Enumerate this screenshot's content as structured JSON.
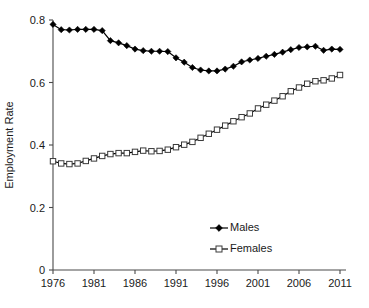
{
  "chart_data": {
    "type": "line",
    "title": "",
    "xlabel": "",
    "ylabel": "Employment Rate",
    "xlim": [
      1976,
      2011
    ],
    "ylim": [
      0,
      0.8
    ],
    "grid": false,
    "legend_position": "bottom-center",
    "xticks": [
      1976,
      1981,
      1986,
      1991,
      1996,
      2001,
      2006,
      2011
    ],
    "xtick_labels": [
      "1976",
      "1981",
      "1986",
      "1991",
      "1996",
      "2001",
      "2006",
      "2011"
    ],
    "yticks": [
      0,
      0.2,
      0.4,
      0.6,
      0.8
    ],
    "ytick_labels": [
      "0",
      "0.2",
      "0.4",
      "0.6",
      "0.8"
    ],
    "x": [
      1976,
      1977,
      1978,
      1979,
      1980,
      1981,
      1982,
      1983,
      1984,
      1985,
      1986,
      1987,
      1988,
      1989,
      1990,
      1991,
      1992,
      1993,
      1994,
      1995,
      1996,
      1997,
      1998,
      1999,
      2000,
      2001,
      2002,
      2003,
      2004,
      2005,
      2006,
      2007,
      2008,
      2009,
      2010,
      2011
    ],
    "series": [
      {
        "name": "Males",
        "marker": "filled-diamond",
        "color": "#000000",
        "values": [
          0.786,
          0.769,
          0.768,
          0.77,
          0.77,
          0.77,
          0.766,
          0.734,
          0.727,
          0.718,
          0.707,
          0.702,
          0.7,
          0.7,
          0.699,
          0.679,
          0.665,
          0.648,
          0.64,
          0.637,
          0.637,
          0.643,
          0.652,
          0.666,
          0.672,
          0.677,
          0.684,
          0.69,
          0.697,
          0.705,
          0.712,
          0.714,
          0.716,
          0.703,
          0.707,
          0.706
        ]
      },
      {
        "name": "Females",
        "marker": "open-square",
        "color": "#3a3a3a",
        "values": [
          0.348,
          0.341,
          0.339,
          0.341,
          0.349,
          0.357,
          0.365,
          0.371,
          0.374,
          0.374,
          0.378,
          0.382,
          0.38,
          0.381,
          0.385,
          0.393,
          0.401,
          0.41,
          0.423,
          0.436,
          0.449,
          0.462,
          0.476,
          0.489,
          0.501,
          0.517,
          0.529,
          0.542,
          0.556,
          0.572,
          0.584,
          0.596,
          0.604,
          0.607,
          0.613,
          0.624
        ]
      }
    ]
  },
  "legend": {
    "items": [
      {
        "label": "Males"
      },
      {
        "label": "Females"
      }
    ]
  },
  "axis": {
    "y_title": "Employment Rate"
  }
}
